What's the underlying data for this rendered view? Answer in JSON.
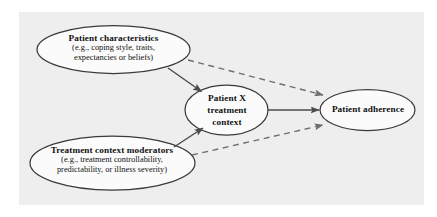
{
  "figure": {
    "background_color": "#ffffff",
    "panel_color": "#eeeeee",
    "node_fill": "#fbfbfb",
    "node_stroke": "#3a3a3a",
    "solid_edge_color": "#4a4a4a",
    "dashed_edge_color": "#6e6e6e"
  },
  "nodes": {
    "patient_characteristics": {
      "title": "Patient characteristics",
      "sub_line1_italic": "e.g.",
      "sub_line1": "(e.g., coping style, traits,",
      "sub_line2": "expectancies or beliefs)"
    },
    "treatment_context_moderators": {
      "title": "Treatment context moderators",
      "sub_line1": "(e.g., treatment controllability,",
      "sub_line2": "predictability, or illness severity)"
    },
    "patient_x_treatment_context": {
      "title_line1": "Patient X",
      "title_line2": "treatment",
      "title_line3": "context"
    },
    "patient_adherence": {
      "title": "Patient adherence"
    }
  },
  "edges": [
    {
      "id": "characteristics-to-context",
      "style": "solid",
      "from": "patient_characteristics",
      "to": "patient_x_treatment_context"
    },
    {
      "id": "moderators-to-context",
      "style": "solid",
      "from": "treatment_context_moderators",
      "to": "patient_x_treatment_context"
    },
    {
      "id": "context-to-adherence",
      "style": "solid",
      "from": "patient_x_treatment_context",
      "to": "patient_adherence"
    },
    {
      "id": "characteristics-to-adherence",
      "style": "dashed",
      "from": "patient_characteristics",
      "to": "patient_adherence"
    },
    {
      "id": "moderators-to-adherence",
      "style": "dashed",
      "from": "treatment_context_moderators",
      "to": "patient_adherence"
    }
  ]
}
